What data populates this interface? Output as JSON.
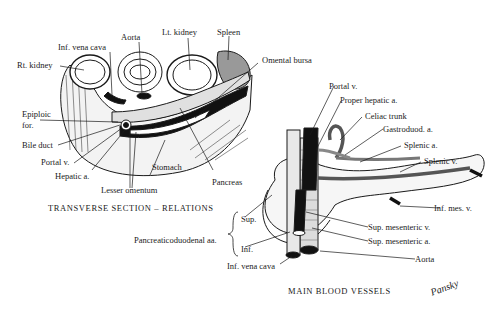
{
  "left_panel": {
    "caption": "TRANSVERSE SECTION – RELATIONS",
    "labels": {
      "aorta": "Aorta",
      "lt_kidney": "Lt. kidney",
      "spleen": "Spleen",
      "inf_vena_cava": "Inf. vena cava",
      "rt_kidney": "Rt. kidney",
      "omental_bursa": "Omental bursa",
      "epiploic_for_1": "Epiploic",
      "epiploic_for_2": "for.",
      "bile_duct": "Bile duct",
      "portal_v": "Portal v.",
      "hepatic_a": "Hepatic a.",
      "stomach": "Stomach",
      "lesser_omentum": "Lesser omentum",
      "pancreas": "Pancreas"
    }
  },
  "right_panel": {
    "caption": "MAIN BLOOD VESSELS",
    "labels": {
      "portal_v": "Portal v.",
      "proper_hepatic_a": "Proper hepatic a.",
      "celiac_trunk": "Celiac trunk",
      "gastroduod_a": "Gastroduod. a.",
      "splenic_a": "Splenic a.",
      "splenic_v": "Splenic v.",
      "inf_mes_v": "Inf. mes. v.",
      "sup_mesenteric_v": "Sup. mesenteric v.",
      "sup_mesenteric_a": "Sup. mesenteric a.",
      "aorta": "Aorta",
      "pancreaticoduodenal": "Pancreaticoduodenal aa.",
      "sup": "Sup.",
      "inf": "Inf.",
      "inf_vena_cava": "Inf. vena cava"
    }
  },
  "signature": "Pansky"
}
